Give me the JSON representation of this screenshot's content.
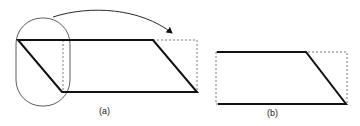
{
  "figure": {
    "panels": [
      {
        "label": "(a)",
        "description": "Parallelogram with left triangle circled and moved to the right (arrow)"
      },
      {
        "label": "(b)",
        "description": "Resulting shape with dashed bounding rectangle"
      }
    ],
    "colors": {
      "stroke": "#111111",
      "dashed": "#555555"
    }
  }
}
